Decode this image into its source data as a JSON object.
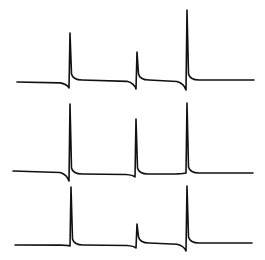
{
  "chart_data": {
    "type": "line",
    "title": "",
    "xlabel": "",
    "ylabel": "",
    "grid": false,
    "legend": null,
    "line_color": "#111111",
    "background": "#ffffff",
    "series": [
      {
        "name": "trace-1",
        "baseline_y": 82,
        "x_start": 17,
        "x_end": 254,
        "end_y": 80,
        "spikes": [
          {
            "x": 70,
            "peak_y": 33,
            "dip_y": 88,
            "after_y": 80
          },
          {
            "x": 137,
            "peak_y": 52,
            "dip_y": 89,
            "after_y": 80
          },
          {
            "x": 187,
            "peak_y": 10,
            "dip_y": 90,
            "after_y": 80
          }
        ]
      },
      {
        "name": "trace-2",
        "baseline_y": 171,
        "x_start": 13,
        "x_end": 253,
        "end_y": 173,
        "spikes": [
          {
            "x": 70,
            "peak_y": 104,
            "dip_y": 181,
            "after_y": 174
          },
          {
            "x": 136,
            "peak_y": 119,
            "dip_y": 177,
            "after_y": 174
          },
          {
            "x": 187,
            "peak_y": 103,
            "dip_y": 173,
            "after_y": 173
          }
        ]
      },
      {
        "name": "trace-3",
        "baseline_y": 245,
        "x_start": 15,
        "x_end": 252,
        "end_y": 243,
        "spikes": [
          {
            "x": 71,
            "peak_y": 187,
            "dip_y": 246,
            "after_y": 245
          },
          {
            "x": 137,
            "peak_y": 224,
            "dip_y": 248,
            "after_y": 243
          },
          {
            "x": 187,
            "peak_y": 186,
            "dip_y": 251,
            "after_y": 243
          }
        ]
      }
    ]
  }
}
